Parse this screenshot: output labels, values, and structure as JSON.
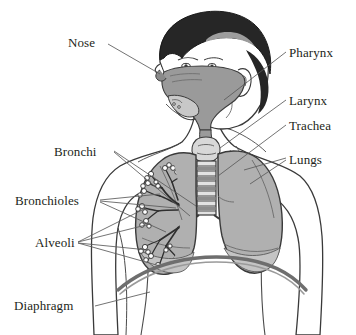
{
  "figure": {
    "background_color": "#ffffff",
    "line_color": "#3a3a3a",
    "label_color": "#231f20",
    "tissue_fill": "#b0b0b0",
    "cavity_fill": "#9a9a9a",
    "hair_fill": "#262626",
    "skin_fill": "#ffffff",
    "diaphragm_color": "#6e6e6e"
  },
  "labels": [
    {
      "id": "nose",
      "text": "Nose",
      "x": 68,
      "y": 36,
      "align": "left"
    },
    {
      "id": "bronchi",
      "text": "Bronchi",
      "x": 54,
      "y": 145,
      "align": "left"
    },
    {
      "id": "bronchioles",
      "text": "Bronchioles",
      "x": 15,
      "y": 194,
      "align": "left"
    },
    {
      "id": "alveoli",
      "text": "Alveoli",
      "x": 35,
      "y": 236,
      "align": "left"
    },
    {
      "id": "diaphragm",
      "text": "Diaphragm",
      "x": 14,
      "y": 299,
      "align": "left"
    },
    {
      "id": "pharynx",
      "text": "Pharynx",
      "x": 289,
      "y": 46,
      "align": "left"
    },
    {
      "id": "larynx",
      "text": "Larynx",
      "x": 289,
      "y": 94,
      "align": "left"
    },
    {
      "id": "trachea",
      "text": "Trachea",
      "x": 289,
      "y": 119,
      "align": "left"
    },
    {
      "id": "lungs",
      "text": "Lungs",
      "x": 289,
      "y": 153,
      "align": "left"
    }
  ],
  "structures": [
    {
      "id": "head",
      "name": "head-profile"
    },
    {
      "id": "hair",
      "name": "hair"
    },
    {
      "id": "nasal-cavity",
      "name": "nasal-cavity"
    },
    {
      "id": "pharynx",
      "name": "pharynx-cavity"
    },
    {
      "id": "larynx",
      "name": "larynx"
    },
    {
      "id": "trachea",
      "name": "trachea-with-cartilage-rings"
    },
    {
      "id": "left-lung",
      "name": "left-lung"
    },
    {
      "id": "right-lung",
      "name": "right-lung"
    },
    {
      "id": "bronchial-tree",
      "name": "bronchial-tree"
    },
    {
      "id": "diaphragm",
      "name": "diaphragm-arc"
    },
    {
      "id": "torso",
      "name": "torso-and-shoulders"
    }
  ]
}
